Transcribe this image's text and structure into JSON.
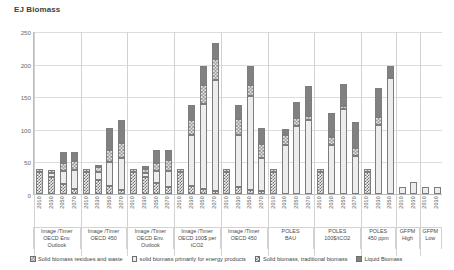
{
  "chart_data": {
    "type": "bar",
    "title": "EJ Biomass",
    "xlabel": "",
    "ylabel": "EJ Biomass",
    "ylim": [
      0,
      250
    ],
    "yticks": [
      0,
      50,
      100,
      150,
      200,
      250
    ],
    "grid": true,
    "stacked": true,
    "legend_position": "bottom",
    "legend": [
      "Solid biomass residues and waste",
      "solid biomass primarily for energy products",
      "Solid biomass, traditional biomass",
      "Liquid Biomass"
    ],
    "series": [
      {
        "name": "Solid biomass, traditional biomass",
        "pattern": "p-trad"
      },
      {
        "name": "solid biomass primarily for energy products",
        "pattern": "p-energy"
      },
      {
        "name": "Solid biomass residues and waste",
        "pattern": "p-resid"
      },
      {
        "name": "Liquid Biomass",
        "pattern": "p-liquid"
      }
    ],
    "groups": [
      {
        "model": "Image /Timer",
        "scenario": "OECD Env. Outlook",
        "bars": [
          {
            "year": "2010",
            "traditional": 33,
            "energy": 0,
            "residues": 5,
            "liquid": 0
          },
          {
            "year": "2030",
            "traditional": 26,
            "energy": 7,
            "residues": 4,
            "liquid": 0
          },
          {
            "year": "2050",
            "traditional": 15,
            "energy": 20,
            "residues": 13,
            "liquid": 17
          },
          {
            "year": "2070",
            "traditional": 8,
            "energy": 29,
            "residues": 14,
            "liquid": 14
          }
        ]
      },
      {
        "model": "Image /Timer",
        "scenario": "OECD 450",
        "bars": [
          {
            "year": "2010",
            "traditional": 33,
            "energy": 0,
            "residues": 5,
            "liquid": 0
          },
          {
            "year": "2030",
            "traditional": 22,
            "energy": 11,
            "residues": 9,
            "liquid": 3
          },
          {
            "year": "2050",
            "traditional": 12,
            "energy": 37,
            "residues": 19,
            "liquid": 33
          },
          {
            "year": "2070",
            "traditional": 6,
            "energy": 50,
            "residues": 22,
            "liquid": 35
          }
        ]
      },
      {
        "model": "Image /Timer",
        "scenario": "OECD Env. Outlook",
        "bars": [
          {
            "year": "2010",
            "traditional": 33,
            "energy": 0,
            "residues": 5,
            "liquid": 0
          },
          {
            "year": "2030",
            "traditional": 26,
            "energy": 7,
            "residues": 5,
            "liquid": 5
          },
          {
            "year": "2050",
            "traditional": 17,
            "energy": 18,
            "residues": 12,
            "liquid": 20
          },
          {
            "year": "2070",
            "traditional": 10,
            "energy": 26,
            "residues": 16,
            "liquid": 15
          }
        ]
      },
      {
        "model": "Image /Timer",
        "scenario": "OECD 100$ per tCO2",
        "bars": [
          {
            "year": "2010",
            "traditional": 33,
            "energy": 0,
            "residues": 5,
            "liquid": 0
          },
          {
            "year": "2030",
            "traditional": 12,
            "energy": 78,
            "residues": 24,
            "liquid": 22
          },
          {
            "year": "2050",
            "traditional": 8,
            "energy": 130,
            "residues": 30,
            "liquid": 28
          },
          {
            "year": "2070",
            "traditional": 5,
            "energy": 170,
            "residues": 32,
            "liquid": 25
          }
        ]
      },
      {
        "model": "Image /Timer",
        "scenario": "OECD 450",
        "bars": [
          {
            "year": "2010",
            "traditional": 33,
            "energy": 0,
            "residues": 5,
            "liquid": 0
          },
          {
            "year": "2030",
            "traditional": 10,
            "energy": 80,
            "residues": 25,
            "liquid": 22
          },
          {
            "year": "2050",
            "traditional": 6,
            "energy": 145,
            "residues": 16,
            "liquid": 30
          },
          {
            "year": "2070",
            "traditional": 5,
            "energy": 50,
            "residues": 21,
            "liquid": 26
          }
        ]
      },
      {
        "model": "POLES",
        "scenario": "BAU",
        "bars": [
          {
            "year": "2010",
            "traditional": 33,
            "energy": 0,
            "residues": 5,
            "liquid": 0
          },
          {
            "year": "2030",
            "traditional": 0,
            "energy": 75,
            "residues": 15,
            "liquid": 10
          },
          {
            "year": "2050",
            "traditional": 0,
            "energy": 105,
            "residues": 11,
            "liquid": 25
          },
          {
            "year": "2070",
            "traditional": 0,
            "energy": 113,
            "residues": 6,
            "liquid": 47
          }
        ]
      },
      {
        "model": "POLES",
        "scenario": "100$/tCO2",
        "bars": [
          {
            "year": "2010",
            "traditional": 33,
            "energy": 0,
            "residues": 5,
            "liquid": 0
          },
          {
            "year": "2030",
            "traditional": 0,
            "energy": 75,
            "residues": 12,
            "liquid": 38
          },
          {
            "year": "2050",
            "traditional": 0,
            "energy": 130,
            "residues": 5,
            "liquid": 34
          },
          {
            "year": "2070",
            "traditional": 0,
            "energy": 58,
            "residues": 13,
            "liquid": 40
          }
        ]
      },
      {
        "model": "POLES",
        "scenario": "450 ppm",
        "bars": [
          {
            "year": "2010",
            "traditional": 33,
            "energy": 0,
            "residues": 5,
            "liquid": 0
          },
          {
            "year": "2030",
            "traditional": 0,
            "energy": 106,
            "residues": 12,
            "liquid": 45
          },
          {
            "year": "2050",
            "traditional": 0,
            "energy": 178,
            "residues": 0,
            "liquid": 18
          }
        ]
      },
      {
        "model": "GFPM",
        "scenario": "High",
        "bars": [
          {
            "year": "2010",
            "traditional": 0,
            "energy": 11,
            "residues": 0,
            "liquid": 0
          },
          {
            "year": "2030",
            "traditional": 0,
            "energy": 18,
            "residues": 0,
            "liquid": 0
          }
        ]
      },
      {
        "model": "GFPM",
        "scenario": "Low",
        "bars": [
          {
            "year": "2010",
            "traditional": 0,
            "energy": 10,
            "residues": 0,
            "liquid": 0
          },
          {
            "year": "2030",
            "traditional": 0,
            "energy": 11,
            "residues": 0,
            "liquid": 0
          }
        ]
      }
    ]
  }
}
